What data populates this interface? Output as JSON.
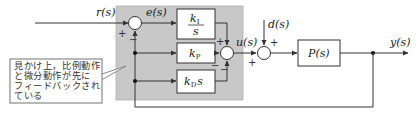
{
  "diagram": {
    "type": "block-diagram",
    "signals": {
      "reference": "r(s)",
      "error": "e(s)",
      "control": "u(s)",
      "disturbance": "d(s)",
      "output": "y(s)"
    },
    "blocks": {
      "integral_num": "k",
      "integral_num_sub": "I",
      "integral_den": "s",
      "proportional": "k",
      "proportional_sub": "P",
      "derivative": "k",
      "derivative_sub": "D",
      "derivative_var": "s",
      "plant": "P(s)"
    },
    "signs": {
      "sum1_ref": "+",
      "sum1_fb": "−",
      "sum2_i": "+",
      "sum2_p": "−",
      "sum2_d": "−",
      "sum3_d": "+",
      "sum3_u": "+"
    },
    "callout": {
      "lines": [
        "見かけ上，比例動作",
        "と微分動作が先に",
        "フィードバックされ",
        "ている"
      ]
    },
    "colors": {
      "controller_region": "#c8c8c8",
      "line": "#333333",
      "block_fill": "#ffffff",
      "callout_border": "#8a8a8a"
    }
  }
}
